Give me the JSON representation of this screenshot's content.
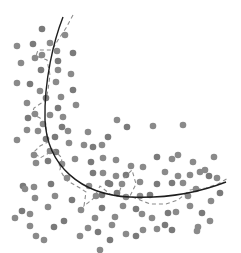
{
  "diagram": {
    "colors": {
      "background": "#ffffff",
      "points": "#8a8a8a",
      "solid_curve": "#1e1e1e",
      "dashed_curve": "#8c8c8c"
    },
    "solid_curve_path": "M 63 17 C 54 40, 44 80, 45 120 C 47 165, 80 195, 130 197 C 170 199, 200 192, 226 182",
    "dashed_curve_path": "M 73 15 L 66 28 L 58 40 L 52 50 L 38 50 L 36 56 L 47 60 L 50 75 L 48 90 L 46 100 L 34 108 L 32 114 L 40 118 L 46 126 L 48 142 L 40 146 L 34 152 L 40 158 L 54 150 L 62 158 L 60 170 L 66 180 L 80 188 L 86 192 L 84 206 L 94 198 L 100 186 L 110 194 L 118 196 L 124 178 L 132 170 L 136 184 L 130 196 L 150 204 L 166 204 L 178 200 L 190 190 L 206 188 L 218 184 L 228 178",
    "points": [
      [
        42,
        29
      ],
      [
        65,
        35
      ],
      [
        17,
        46
      ],
      [
        33,
        44
      ],
      [
        50,
        43
      ],
      [
        57,
        51
      ],
      [
        73,
        53
      ],
      [
        42,
        55
      ],
      [
        35,
        58
      ],
      [
        58,
        61
      ],
      [
        21,
        63
      ],
      [
        58,
        70
      ],
      [
        41,
        70
      ],
      [
        71,
        74
      ],
      [
        17,
        83
      ],
      [
        30,
        84
      ],
      [
        56,
        82
      ],
      [
        40,
        91
      ],
      [
        73,
        90
      ],
      [
        61,
        97
      ],
      [
        27,
        103
      ],
      [
        46,
        98
      ],
      [
        76,
        105
      ],
      [
        35,
        114
      ],
      [
        58,
        108
      ],
      [
        50,
        115
      ],
      [
        63,
        117
      ],
      [
        28,
        118
      ],
      [
        27,
        130
      ],
      [
        43,
        124
      ],
      [
        62,
        127
      ],
      [
        38,
        131
      ],
      [
        17,
        140
      ],
      [
        46,
        139
      ],
      [
        68,
        131
      ],
      [
        88,
        132
      ],
      [
        55,
        137
      ],
      [
        69,
        143
      ],
      [
        50,
        151
      ],
      [
        56,
        152
      ],
      [
        34,
        155
      ],
      [
        84,
        145
      ],
      [
        93,
        147
      ],
      [
        102,
        145
      ],
      [
        117,
        120
      ],
      [
        127,
        127
      ],
      [
        153,
        126
      ],
      [
        183,
        125
      ],
      [
        108,
        137
      ],
      [
        178,
        155
      ],
      [
        36,
        163
      ],
      [
        48,
        161
      ],
      [
        62,
        164
      ],
      [
        75,
        159
      ],
      [
        91,
        162
      ],
      [
        103,
        158
      ],
      [
        116,
        160
      ],
      [
        93,
        173
      ],
      [
        103,
        173
      ],
      [
        89,
        186
      ],
      [
        108,
        183
      ],
      [
        131,
        166
      ],
      [
        143,
        167
      ],
      [
        157,
        157
      ],
      [
        172,
        159
      ],
      [
        193,
        162
      ],
      [
        110,
        184
      ],
      [
        122,
        184
      ],
      [
        140,
        182
      ],
      [
        157,
        184
      ],
      [
        165,
        172
      ],
      [
        178,
        176
      ],
      [
        172,
        183
      ],
      [
        183,
        183
      ],
      [
        205,
        170
      ],
      [
        209,
        176
      ],
      [
        217,
        178
      ],
      [
        196,
        189
      ],
      [
        23,
        186
      ],
      [
        25,
        189
      ],
      [
        34,
        187
      ],
      [
        51,
        184
      ],
      [
        55,
        196
      ],
      [
        67,
        178
      ],
      [
        72,
        200
      ],
      [
        35,
        198
      ],
      [
        30,
        214
      ],
      [
        22,
        211
      ],
      [
        15,
        218
      ],
      [
        48,
        207
      ],
      [
        64,
        221
      ],
      [
        81,
        210
      ],
      [
        95,
        218
      ],
      [
        102,
        208
      ],
      [
        115,
        217
      ],
      [
        123,
        206
      ],
      [
        136,
        209
      ],
      [
        142,
        214
      ],
      [
        152,
        218
      ],
      [
        165,
        225
      ],
      [
        176,
        212
      ],
      [
        190,
        206
      ],
      [
        202,
        213
      ],
      [
        210,
        221
      ],
      [
        198,
        227
      ],
      [
        172,
        230
      ],
      [
        157,
        229
      ],
      [
        143,
        230
      ],
      [
        136,
        236
      ],
      [
        126,
        234
      ],
      [
        112,
        225
      ],
      [
        98,
        232
      ],
      [
        88,
        228
      ],
      [
        80,
        236
      ],
      [
        117,
        193
      ],
      [
        126,
        197
      ],
      [
        140,
        196
      ],
      [
        150,
        195
      ],
      [
        188,
        196
      ],
      [
        214,
        157
      ],
      [
        220,
        193
      ],
      [
        211,
        201
      ],
      [
        197,
        231
      ],
      [
        110,
        240
      ],
      [
        100,
        250
      ],
      [
        30,
        226
      ],
      [
        54,
        227
      ],
      [
        44,
        240
      ],
      [
        36,
        236
      ],
      [
        102,
        195
      ],
      [
        96,
        196
      ],
      [
        116,
        176
      ],
      [
        126,
        175
      ],
      [
        190,
        175
      ],
      [
        200,
        172
      ],
      [
        168,
        213
      ]
    ]
  }
}
